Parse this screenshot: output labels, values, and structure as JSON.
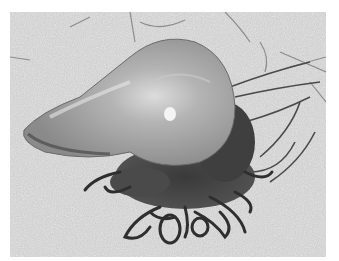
{
  "image": {
    "subject": "Portuguese man o' war stranded on sand",
    "tone": "grayscale",
    "colors": {
      "border": "#ffffff",
      "sand": "#cdcdcd",
      "float": "#9a9a9a",
      "tentacles": "#2e2e2e"
    }
  }
}
